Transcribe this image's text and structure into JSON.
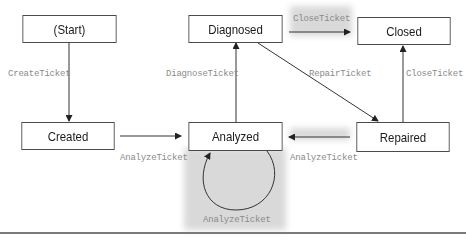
{
  "diagram": {
    "type": "state-machine",
    "states": [
      {
        "id": "start",
        "label": "(Start)"
      },
      {
        "id": "diagnosed",
        "label": "Diagnosed"
      },
      {
        "id": "closed",
        "label": "Closed"
      },
      {
        "id": "created",
        "label": "Created"
      },
      {
        "id": "analyzed",
        "label": "Analyzed"
      },
      {
        "id": "repaired",
        "label": "Repaired"
      }
    ],
    "transitions": [
      {
        "from": "start",
        "to": "created",
        "label": "CreateTicket"
      },
      {
        "from": "created",
        "to": "analyzed",
        "label": "AnalyzeTicket"
      },
      {
        "from": "analyzed",
        "to": "diagnosed",
        "label": "DiagnoseTicket"
      },
      {
        "from": "diagnosed",
        "to": "closed",
        "label": "CloseTicket",
        "highlighted": true
      },
      {
        "from": "diagnosed",
        "to": "repaired",
        "label": "RepairTicket"
      },
      {
        "from": "repaired",
        "to": "closed",
        "label": "CloseTicket"
      },
      {
        "from": "repaired",
        "to": "analyzed",
        "label": "AnalyzeTicket",
        "highlighted": true
      },
      {
        "from": "analyzed",
        "to": "analyzed",
        "label": "AnalyzeTicket",
        "highlighted": true
      }
    ],
    "colors": {
      "highlight": "#d9d9d9",
      "stroke": "#4a4a4a",
      "label": "#8a8a8a"
    }
  }
}
